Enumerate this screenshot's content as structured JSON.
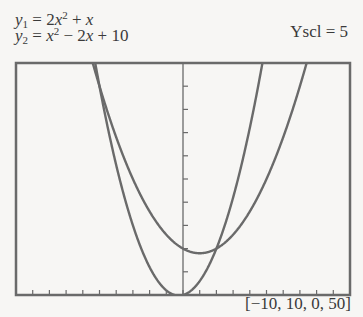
{
  "chart_data": {
    "type": "line",
    "title": "",
    "equations": [
      {
        "name": "y1",
        "label_lhs": "y",
        "label_sub": "1",
        "expression": "2x^2 + x"
      },
      {
        "name": "y2",
        "label_lhs": "y",
        "label_sub": "2",
        "expression": "x^2 - 2x + 10"
      }
    ],
    "series": [
      {
        "name": "y1 = 2x^2 + x",
        "x": [
          -5,
          -4,
          -3,
          -2,
          -1,
          -0.25,
          0,
          1,
          2,
          3,
          4,
          4.75
        ],
        "values": [
          45,
          28,
          15,
          6,
          1,
          -0.125,
          0,
          3,
          10,
          21,
          36,
          49.9
        ]
      },
      {
        "name": "y2 = x^2 - 2x + 10",
        "x": [
          -5,
          -4,
          -3,
          -2,
          -1,
          0,
          1,
          2,
          3,
          4,
          5,
          6,
          7,
          8
        ],
        "values": [
          45,
          34,
          25,
          18,
          13,
          10,
          9,
          10,
          13,
          18,
          25,
          34,
          45,
          58
        ]
      }
    ],
    "window": {
      "xmin": -10,
      "xmax": 10,
      "ymin": 0,
      "ymax": 50
    },
    "xscl": 1,
    "yscl": 5,
    "xlabel": "",
    "ylabel": "",
    "xlim": [
      -10,
      10
    ],
    "ylim": [
      0,
      50
    ],
    "grid": false,
    "legend": "none"
  },
  "labels": {
    "eq1_lhs": "y",
    "eq1_sub": "1",
    "eq1_rhs_a": " = 2",
    "eq1_x": "x",
    "eq1_sup": "2",
    "eq1_rhs_b": " + ",
    "eq1_x2": "x",
    "eq2_lhs": "y",
    "eq2_sub": "2",
    "eq2_eq": " = ",
    "eq2_x": "x",
    "eq2_sup": "2",
    "eq2_rhs_b": " − 2",
    "eq2_x2": "x",
    "eq2_rhs_c": " + 10",
    "yscl": "Yscl = 5",
    "window": "[−10, 10, 0, 50]"
  },
  "colors": {
    "curve": "#6a6a6a",
    "frame": "#6a6a6a",
    "background": "#f7f6f4"
  }
}
